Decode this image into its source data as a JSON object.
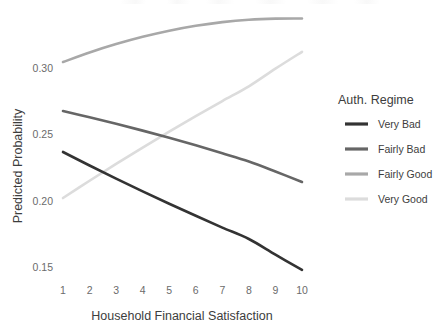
{
  "chart_data": {
    "type": "line",
    "title": "",
    "subtitle": "",
    "xlabel": "Household Financial Satisfaction",
    "ylabel": "Predicted Probability",
    "x": [
      1,
      2,
      3,
      4,
      5,
      6,
      7,
      8,
      9,
      10
    ],
    "xlim": [
      1,
      10
    ],
    "ylim": [
      0.139,
      0.345
    ],
    "xticks": [
      "1",
      "2",
      "3",
      "4",
      "5",
      "6",
      "7",
      "8",
      "9",
      "10"
    ],
    "yticks": [
      "0.15",
      "0.20",
      "0.25",
      "0.30"
    ],
    "ytick_values": [
      0.15,
      0.2,
      0.25,
      0.3
    ],
    "grid": false,
    "legend_position": "right",
    "legend_title": "Auth. Regime",
    "series": [
      {
        "name": "Very Bad",
        "color": "#333333",
        "values": [
          0.2367,
          0.2265,
          0.2166,
          0.207,
          0.1977,
          0.1886,
          0.1797,
          0.1711,
          0.1593,
          0.1478
        ]
      },
      {
        "name": "Fairly Bad",
        "color": "#666666",
        "values": [
          0.2676,
          0.2629,
          0.258,
          0.2528,
          0.2474,
          0.2417,
          0.2357,
          0.2295,
          0.222,
          0.2141
        ]
      },
      {
        "name": "Fairly Good",
        "color": "#a8a8a8",
        "values": [
          0.3045,
          0.3117,
          0.318,
          0.3235,
          0.3281,
          0.3318,
          0.3346,
          0.3364,
          0.3372,
          0.3373
        ]
      },
      {
        "name": "Very Good",
        "color": "#dcdcdc",
        "values": [
          0.202,
          0.215,
          0.2277,
          0.24,
          0.252,
          0.2637,
          0.2751,
          0.2862,
          0.2995,
          0.3122
        ]
      }
    ],
    "annotations": []
  },
  "legend": {
    "title": "Auth. Regime",
    "items": [
      {
        "label": "Very Bad",
        "color": "#333333"
      },
      {
        "label": "Fairly Bad",
        "color": "#666666"
      },
      {
        "label": "Fairly Good",
        "color": "#a8a8a8"
      },
      {
        "label": "Very Good",
        "color": "#dcdcdc"
      }
    ]
  },
  "axes": {
    "x_title": "Household Financial Satisfaction",
    "y_title": "Predicted Probability",
    "x_tick_labels": [
      "1",
      "2",
      "3",
      "4",
      "5",
      "6",
      "7",
      "8",
      "9",
      "10"
    ],
    "y_tick_labels": [
      "0.15",
      "0.20",
      "0.25",
      "0.30"
    ]
  }
}
